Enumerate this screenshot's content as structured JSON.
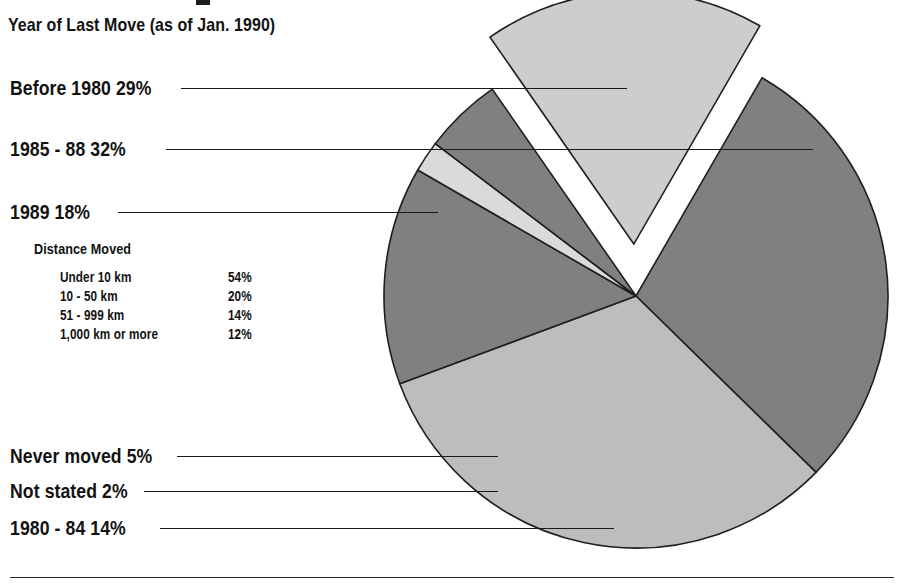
{
  "figure": {
    "subtitle": "Year of Last Move (as of Jan. 1990)",
    "baseline_rule": true
  },
  "inner_table": {
    "title": "Distance Moved",
    "rows": [
      {
        "label": "Under 10 km",
        "value": "54%"
      },
      {
        "label": "10 - 50 km",
        "value": "20%"
      },
      {
        "label": "51 - 999 km",
        "value": "14%"
      },
      {
        "label": "1,000 km or more",
        "value": "12%"
      }
    ]
  },
  "callouts": [
    {
      "text": "Before 1980  29%"
    },
    {
      "text": "1985 - 88  32%"
    },
    {
      "text": "1989  18%"
    },
    {
      "text": "Never moved  5%"
    },
    {
      "text": "Not stated  2%"
    },
    {
      "text": "1980 - 84  14%"
    }
  ],
  "chart_data": {
    "type": "pie",
    "title": "Year of Last Move (as of Jan. 1990)",
    "xlabel": "",
    "ylabel": "",
    "legend": "callout-labels-left",
    "grid": false,
    "units": "percent",
    "total": 100,
    "start_angle_deg": -60,
    "direction": "clockwise",
    "categories": [
      "Before 1980",
      "1985 - 88",
      "1980 - 84",
      "Not stated",
      "Never moved",
      "1989"
    ],
    "values": [
      29,
      32,
      14,
      2,
      5,
      18
    ],
    "value_labels": [
      "29%",
      "32%",
      "14%",
      "2%",
      "5%",
      "18%"
    ],
    "colors": [
      "#808080",
      "#bdbdbd",
      "#808080",
      "#dadada",
      "#808080",
      "#cdcdcd"
    ],
    "exploded": [
      false,
      false,
      false,
      false,
      false,
      true
    ],
    "slice_edge_color": "#1f1f1f",
    "secondary_table": {
      "type": "table",
      "title": "Distance Moved",
      "categories": [
        "Under 10 km",
        "10 - 50 km",
        "51 - 999 km",
        "1,000 km or more"
      ],
      "values": [
        54,
        20,
        14,
        12
      ],
      "value_labels": [
        "54%",
        "20%",
        "14%",
        "12%"
      ]
    }
  },
  "colors": {
    "ink": "#121212",
    "rule": "#1a1a1a",
    "slice_dark": "#808080",
    "slice_mid": "#bdbdbd",
    "slice_light": "#cdcdcd",
    "slice_pale": "#dadada",
    "background": "#ffffff"
  }
}
